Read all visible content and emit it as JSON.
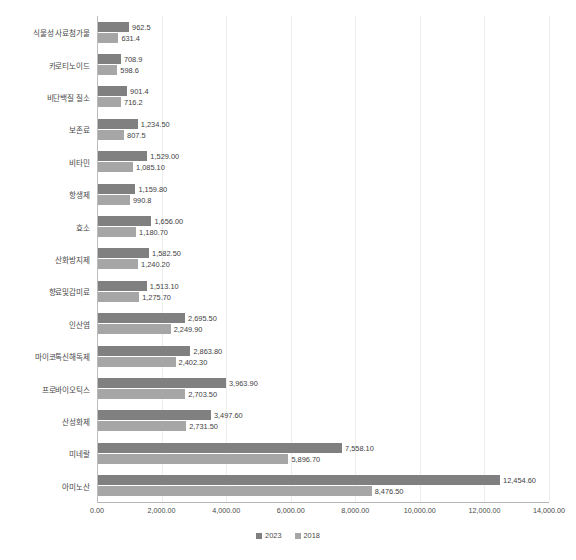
{
  "chart_data": {
    "type": "bar",
    "orientation": "horizontal",
    "title": "",
    "subtitle": "",
    "xlabel": "",
    "ylabel": "",
    "xlim": [
      0,
      14000
    ],
    "xticks": [
      "0.00",
      "2,000.00",
      "4,000.00",
      "6,000.00",
      "8,000.00",
      "10,000.00",
      "12,000.00",
      "14,000.00"
    ],
    "xtick_values": [
      0,
      2000,
      4000,
      6000,
      8000,
      10000,
      12000,
      14000
    ],
    "grid": true,
    "grid_axis": "x",
    "legend_position": "bottom",
    "categories": [
      "식물성 사료첨가물",
      "카로티노이드",
      "비단백질 질소",
      "보존료",
      "비타민",
      "항생제",
      "효소",
      "산화방지제",
      "향료및감미료",
      "인산염",
      "마이코톡신해독제",
      "프로바이오틱스",
      "산성화제",
      "미네랄",
      "아미노산"
    ],
    "series": [
      {
        "name": "2023",
        "color": "#808080",
        "values": [
          962.5,
          708.9,
          901.4,
          1234.5,
          1529.0,
          1159.8,
          1656.0,
          1582.5,
          1513.1,
          2695.5,
          2863.8,
          3963.9,
          3497.6,
          7558.1,
          12454.6
        ],
        "labels": [
          "962.5",
          "708.9",
          "901.4",
          "1,234.50",
          "1,529.00",
          "1,159.80",
          "1,656.00",
          "1,582.50",
          "1,513.10",
          "2,695.50",
          "2,863.80",
          "3,963.90",
          "3,497.60",
          "7,558.10",
          "12,454.60"
        ]
      },
      {
        "name": "2018",
        "color": "#a6a6a6",
        "values": [
          631.4,
          598.6,
          716.2,
          807.5,
          1085.1,
          990.8,
          1180.7,
          1240.2,
          1275.7,
          2249.9,
          2402.3,
          2703.5,
          2731.5,
          5896.7,
          8476.5
        ],
        "labels": [
          "631.4",
          "598.6",
          "716.2",
          "807.5",
          "1,085.10",
          "990.8",
          "1,180.70",
          "1,240.20",
          "1,275.70",
          "2,249.90",
          "2,402.30",
          "2,703.50",
          "2,731.50",
          "5,896.70",
          "8,476.50"
        ]
      }
    ],
    "legend": [
      {
        "label": "2023",
        "color": "#808080"
      },
      {
        "label": "2018",
        "color": "#a6a6a6"
      }
    ]
  }
}
